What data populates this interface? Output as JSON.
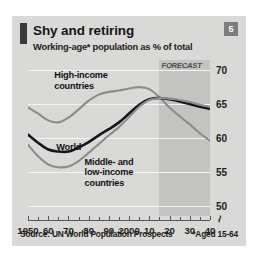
{
  "figure": {
    "badge": "5",
    "title": "Shy and retiring",
    "subtitle": "Working-age* population as % of total",
    "source": "Source: UN World Population Prospects",
    "footnote": "*Aged 15-64"
  },
  "chart_data": {
    "type": "line",
    "title": "Shy and retiring",
    "subtitle": "Working-age* population as % of total",
    "xlabel": "",
    "ylabel": "% of total",
    "xlim": [
      1950,
      2040
    ],
    "ylim": [
      48.5,
      71.5
    ],
    "yticks": [
      50,
      55,
      60,
      65,
      70
    ],
    "ytick_labels": [
      "50",
      "55",
      "60",
      "65",
      "70"
    ],
    "axis_break": true,
    "axis_break_symbol": "≀",
    "grid": true,
    "grid_axis": "y",
    "legend": "inline-annotations",
    "xticks": [
      1950,
      1955,
      1960,
      1965,
      1970,
      1975,
      1980,
      1985,
      1990,
      1995,
      2000,
      2005,
      2010,
      2015,
      2020,
      2025,
      2030,
      2035,
      2040
    ],
    "xtick_labels_major": [
      {
        "year": 1950,
        "label": "1950"
      },
      {
        "year": 1960,
        "label": "60"
      },
      {
        "year": 1970,
        "label": "70"
      },
      {
        "year": 1980,
        "label": "80"
      },
      {
        "year": 1990,
        "label": "90"
      },
      {
        "year": 2000,
        "label": "2000"
      },
      {
        "year": 2010,
        "label": "10"
      },
      {
        "year": 2020,
        "label": "20"
      },
      {
        "year": 2030,
        "label": "30"
      },
      {
        "year": 2040,
        "label": "40"
      }
    ],
    "annotations": [
      {
        "text": "FORECAST",
        "x": 2015,
        "y": 70.6,
        "style": "italic"
      }
    ],
    "forecast_region": {
      "start": 2015,
      "end": 2040,
      "label": "FORECAST"
    },
    "x": [
      1950,
      1955,
      1960,
      1965,
      1970,
      1975,
      1980,
      1985,
      1990,
      1995,
      2000,
      2005,
      2010,
      2015,
      2020,
      2025,
      2030,
      2035,
      2040
    ],
    "series": [
      {
        "name": "High-income countries",
        "color": "#8c8c8a",
        "values": [
          64.5,
          63.6,
          62.6,
          62.3,
          63.0,
          64.2,
          65.5,
          66.4,
          66.8,
          67.0,
          67.3,
          67.5,
          67.2,
          66.0,
          64.5,
          63.2,
          62.0,
          60.7,
          59.6
        ]
      },
      {
        "name": "World",
        "color": "#16161a",
        "values": [
          60.5,
          59.3,
          58.3,
          58.0,
          58.0,
          58.6,
          59.4,
          60.4,
          61.3,
          62.3,
          63.6,
          64.9,
          65.7,
          65.9,
          65.7,
          65.4,
          65.0,
          64.6,
          64.3
        ]
      },
      {
        "name": "Middle- and low-income countries",
        "color": "#8c8c8a",
        "values": [
          59.0,
          57.3,
          56.1,
          55.7,
          55.8,
          56.6,
          57.8,
          59.1,
          60.4,
          61.6,
          63.1,
          64.6,
          65.6,
          65.9,
          65.8,
          65.6,
          65.3,
          64.9,
          64.6
        ]
      }
    ],
    "series_labels": [
      {
        "name": "High-income countries",
        "line1": "High-income",
        "line2": "countries"
      },
      {
        "name": "World",
        "line1": "World",
        "line2": ""
      },
      {
        "name": "Middle- and low-income countries",
        "line1": "Middle- and",
        "line2": "low-income",
        "line3": "countries"
      }
    ]
  },
  "colors": {
    "panel_bg": "#d9d9d7",
    "accent_bar": "#3a3a3a",
    "badge_bg": "#7d7d7d",
    "gridline": "#f4f4f2",
    "axis": "#55565a",
    "forecast_band": "rgba(120,120,120,0.22)",
    "series_dark": "#16161a",
    "series_grey": "#8c8c8a"
  }
}
